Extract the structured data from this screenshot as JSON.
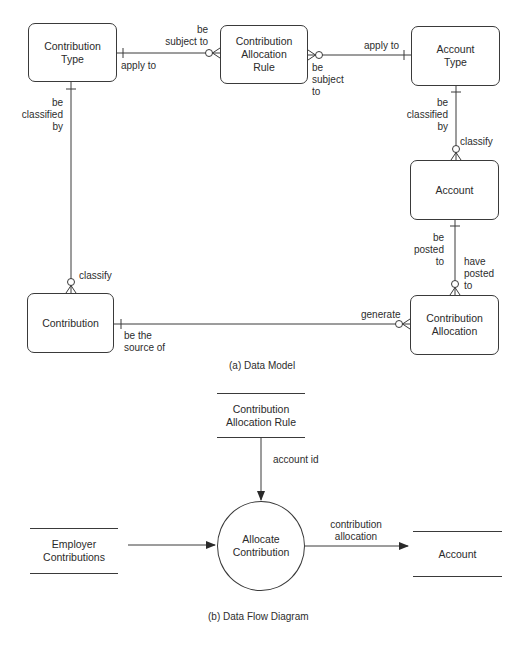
{
  "data_model": {
    "caption": "(a) Data Model",
    "entities": {
      "contribution_type": "Contribution\nType",
      "contribution_allocation_rule": "Contribution\nAllocation\nRule",
      "account_type": "Account\nType",
      "account": "Account",
      "contribution": "Contribution",
      "contribution_allocation": "Contribution\nAllocation"
    },
    "relationships": {
      "ct_car_from": "apply to",
      "ct_car_to": "be\nsubject to",
      "at_car_from": "apply to",
      "at_car_to": "be\nsubject\nto",
      "ct_c_from": "be\nclassified\nby",
      "ct_c_to": "classify",
      "at_a_from": "be\nclassified\nby",
      "at_a_to": "classify",
      "a_ca_from": "be\nposted\nto",
      "a_ca_to": "have\nposted\nto",
      "c_ca_from": "be the\nsource of",
      "c_ca_to": "generate"
    }
  },
  "data_flow": {
    "caption": "(b) Data Flow Diagram",
    "stores": {
      "contribution_allocation_rule": "Contribution\nAllocation Rule",
      "employer_contributions": "Employer\nContributions",
      "account": "Account"
    },
    "process": "Allocate\nContribution",
    "flows": {
      "account_id": "account id",
      "contribution_allocation": "contribution\nallocation"
    }
  }
}
